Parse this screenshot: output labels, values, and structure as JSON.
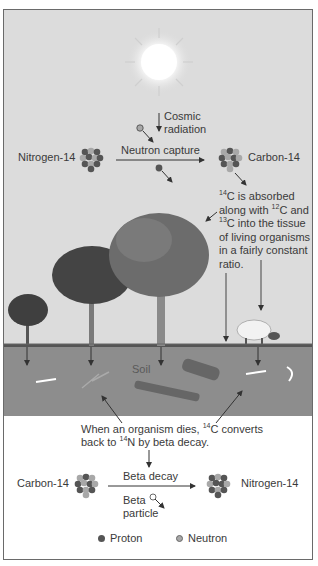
{
  "diagram": {
    "top": {
      "cosmic_radiation_line1": "Cosmic",
      "cosmic_radiation_line2": "radiation",
      "left_isotope": "Nitrogen-14",
      "right_isotope": "Carbon-14",
      "reaction_label": "Neutron capture"
    },
    "absorption_note": {
      "line1_sup": "14",
      "line1": "C is absorbed",
      "line2_pre": "along with ",
      "line2_sup": "12",
      "line2_post": "C and",
      "line3_sup": "13",
      "line3": "C into the tissue",
      "line4": "of living organisms",
      "line5": "in a fairly constant",
      "line6": "ratio."
    },
    "soil_label": "Soil",
    "death_note": {
      "line1_pre": "When an organism dies, ",
      "line1_sup": "14",
      "line1_post": "C converts",
      "line2_pre": "back to ",
      "line2_sup": "14",
      "line2_post": "N by beta decay."
    },
    "bottom": {
      "left_isotope": "Carbon-14",
      "right_isotope": "Nitrogen-14",
      "reaction_label": "Beta decay",
      "particle_line1": "Beta",
      "particle_line2": "particle"
    },
    "legend": {
      "items": [
        {
          "label": "Proton",
          "color": "#555555"
        },
        {
          "label": "Neutron",
          "color": "#a8a8a8"
        }
      ]
    },
    "colors": {
      "sky": "#dcdcdc",
      "soil": "#8d8d8d",
      "proton": "#555555",
      "neutron": "#a8a8a8",
      "text": "#3a3a3a"
    }
  }
}
